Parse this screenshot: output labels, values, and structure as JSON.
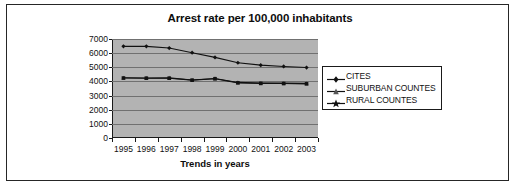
{
  "chart_data": {
    "type": "line",
    "title": "Arrest rate per 100,000 inhabitants",
    "xlabel": "Trends in years",
    "ylabel": "",
    "categories": [
      "1995",
      "1996",
      "1997",
      "1998",
      "1999",
      "2000",
      "2001",
      "2002",
      "2003"
    ],
    "ylim": [
      0,
      7000
    ],
    "yticks": [
      7000,
      6000,
      5000,
      4000,
      3000,
      2000,
      1000,
      0
    ],
    "grid": true,
    "legend_position": "right",
    "plot_background": "#b3b3b3",
    "series": [
      {
        "name": "CITES",
        "marker": "diamond",
        "color": "#111111",
        "values": [
          6480,
          6480,
          6360,
          6030,
          5700,
          5320,
          5150,
          5060,
          4980
        ]
      },
      {
        "name": "SUBURBAN COUNTES",
        "marker": "triangle",
        "color": "#111111",
        "values": [
          4260,
          4240,
          4250,
          4100,
          4210,
          3930,
          3890,
          3880,
          3860
        ]
      },
      {
        "name": "RURAL COUNTES",
        "marker": "star",
        "color": "#111111",
        "values": [
          4240,
          4230,
          4230,
          4090,
          4190,
          3900,
          3860,
          3850,
          3830
        ]
      }
    ]
  },
  "legend": {
    "items": [
      {
        "label": "CITES"
      },
      {
        "label": "SUBURBAN COUNTES"
      },
      {
        "label": "RURAL COUNTES"
      }
    ]
  }
}
